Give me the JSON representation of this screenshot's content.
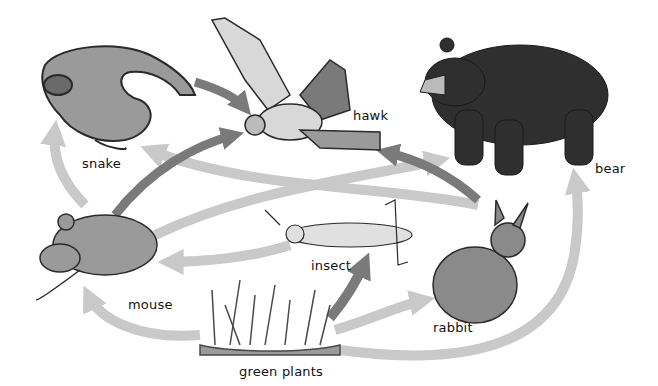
{
  "diagram": {
    "colors": {
      "arrow_dark": "#7a7a7a",
      "arrow_light": "#c9c9c9",
      "background": "#ffffff",
      "ink": "#2a2a2a"
    },
    "organisms": [
      {
        "id": "snake",
        "label": "snake"
      },
      {
        "id": "hawk",
        "label": "hawk"
      },
      {
        "id": "bear",
        "label": "bear"
      },
      {
        "id": "mouse",
        "label": "mouse"
      },
      {
        "id": "insect",
        "label": "insect"
      },
      {
        "id": "rabbit",
        "label": "rabbit"
      },
      {
        "id": "green_plants",
        "label": "green plants"
      }
    ],
    "arrows": [
      {
        "from": "snake",
        "to": "hawk",
        "shade": "dark"
      },
      {
        "from": "mouse",
        "to": "hawk",
        "shade": "dark"
      },
      {
        "from": "rabbit",
        "to": "hawk",
        "shade": "dark"
      },
      {
        "from": "green_plants",
        "to": "insect",
        "shade": "dark"
      },
      {
        "from": "mouse",
        "to": "snake",
        "shade": "light"
      },
      {
        "from": "rabbit",
        "to": "snake",
        "shade": "light"
      },
      {
        "from": "mouse",
        "to": "bear",
        "shade": "light"
      },
      {
        "from": "insect",
        "to": "mouse",
        "shade": "light"
      },
      {
        "from": "green_plants",
        "to": "mouse",
        "shade": "light"
      },
      {
        "from": "green_plants",
        "to": "rabbit",
        "shade": "light"
      },
      {
        "from": "green_plants",
        "to": "bear",
        "shade": "light"
      }
    ]
  }
}
